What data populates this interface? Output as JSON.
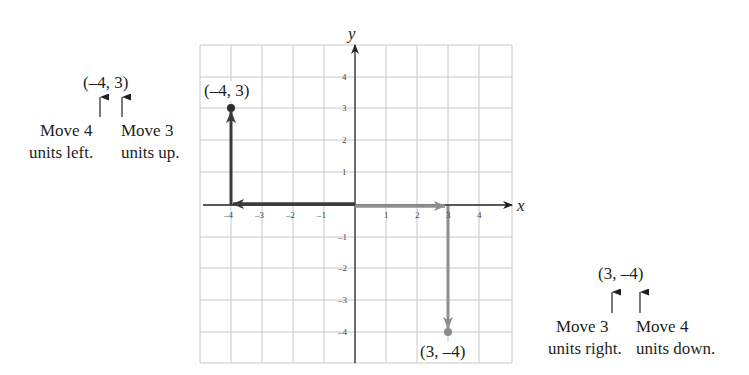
{
  "diagram": {
    "x_axis_label": "x",
    "y_axis_label": "y",
    "x_ticks": [
      "–4",
      "–3",
      "–2",
      "–1",
      "1",
      "2",
      "3",
      "4"
    ],
    "y_ticks": [
      "4",
      "3",
      "2",
      "1",
      "–1",
      "–2",
      "–3",
      "–4"
    ],
    "points": [
      {
        "label": "(–4, 3)",
        "x": -4,
        "y": 3,
        "color": "#2d2d2d"
      },
      {
        "label": "(3, –4)",
        "x": 3,
        "y": -4,
        "color": "#8a8a8a"
      }
    ],
    "colors": {
      "grid": "#c8c8c8",
      "axis": "#231f20",
      "dark_path": "#3a3a3a",
      "light_path": "#8f8f8f"
    }
  },
  "left_annotation": {
    "pair": "(–4, 3)",
    "move1_line1": "Move 4",
    "move1_line2": "units left.",
    "move2_line1": "Move 3",
    "move2_line2": "units up."
  },
  "right_annotation": {
    "pair": "(3, –4)",
    "move1_line1": "Move 3",
    "move1_line2": "units right.",
    "move2_line1": "Move 4",
    "move2_line2": "units down."
  }
}
